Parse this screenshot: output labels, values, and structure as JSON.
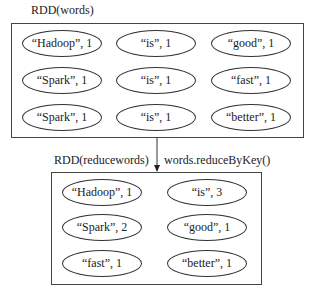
{
  "top_rdd": {
    "label": "RDD(words)",
    "pairs": [
      {
        "text": "“Hadoop”, 1"
      },
      {
        "text": "“is”, 1"
      },
      {
        "text": "“good”, 1"
      },
      {
        "text": "“Spark”, 1"
      },
      {
        "text": "“is”, 1"
      },
      {
        "text": "“fast”, 1"
      },
      {
        "text": "“Spark”, 1"
      },
      {
        "text": "“is”, 1"
      },
      {
        "text": "“better”, 1"
      }
    ]
  },
  "transformation": {
    "label": "words.reduceByKey()"
  },
  "bottom_rdd": {
    "label": "RDD(reducewords)",
    "pairs": [
      {
        "text": "“Hadoop”, 1"
      },
      {
        "text": "“is”, 3"
      },
      {
        "text": "“Spark”, 2"
      },
      {
        "text": "“good”, 1"
      },
      {
        "text": "“fast”, 1"
      },
      {
        "text": "“better”, 1"
      }
    ]
  }
}
